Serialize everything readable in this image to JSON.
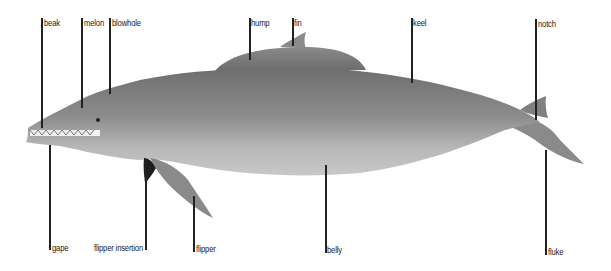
{
  "diagram": {
    "colors": {
      "back": "#7a7a7a",
      "body": "#9a9a9a",
      "belly": "#c4c4c4",
      "label_line": "#222222"
    },
    "labels_top": [
      {
        "id": "beak",
        "text": "beak",
        "x": 42,
        "y": 18,
        "line_bottom": 128
      },
      {
        "id": "melon",
        "text": "melon",
        "x": 82,
        "y": 18,
        "line_bottom": 108
      },
      {
        "id": "blowhole",
        "text": "blowhole",
        "x": 110,
        "y": 18,
        "line_bottom": 94
      },
      {
        "id": "hump",
        "text": "hump",
        "x": 250,
        "y": 18,
        "line_bottom": 60
      },
      {
        "id": "fin",
        "text": "fin",
        "x": 293,
        "y": 18,
        "line_bottom": 46
      },
      {
        "id": "keel",
        "text": "keel",
        "x": 412,
        "y": 18,
        "line_bottom": 83
      },
      {
        "id": "notch",
        "text": "notch",
        "x": 536,
        "y": 19,
        "line_bottom": 120
      }
    ],
    "labels_bottom": [
      {
        "id": "gape",
        "text": "gape",
        "x": 50,
        "y": 243,
        "line_top": 145
      },
      {
        "id": "flipper-insertion",
        "text": "flipper insertion",
        "x": 146,
        "y": 243,
        "line_top": 160
      },
      {
        "id": "flipper",
        "text": "flipper",
        "x": 194,
        "y": 244,
        "line_top": 196
      },
      {
        "id": "belly",
        "text": "belly",
        "x": 326,
        "y": 245,
        "line_top": 165
      },
      {
        "id": "fluke",
        "text": "fluke",
        "x": 546,
        "y": 247,
        "line_top": 150
      }
    ]
  }
}
